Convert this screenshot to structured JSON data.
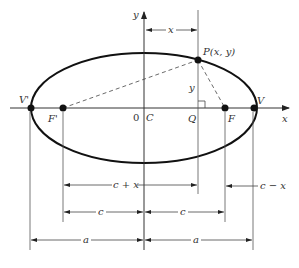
{
  "diagram": {
    "axes": {
      "x_label": "x",
      "y_label": "y",
      "origin_label": "0",
      "center_label": "C"
    },
    "points": {
      "vertex_left": "V'",
      "vertex_right": "V",
      "focus_left": "F'",
      "focus_right": "F",
      "point_p": "P(x, y)",
      "foot_q": "Q"
    },
    "segment_labels": {
      "top_x": "x",
      "vertical_y": "y"
    },
    "dimensions": {
      "c_plus_x": "c + x",
      "c_minus_x": "c − x",
      "c_left": "c",
      "c_right": "c",
      "a_left": "a",
      "a_right": "a"
    },
    "colors": {
      "stroke": "#111111",
      "thin": "#555555",
      "text": "#333333"
    }
  }
}
